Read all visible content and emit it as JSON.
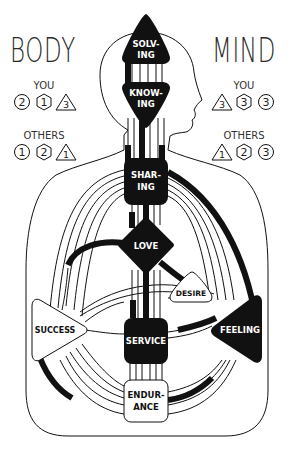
{
  "diagram": {
    "left_panel": {
      "title": "BODY",
      "you_label": "YOU",
      "you_icons": [
        {
          "shape": "circle",
          "value": "2"
        },
        {
          "shape": "hexagon",
          "value": "1"
        },
        {
          "shape": "triangle",
          "value": "3"
        }
      ],
      "others_label": "OTHERS",
      "others_icons": [
        {
          "shape": "circle",
          "value": "1"
        },
        {
          "shape": "hexagon",
          "value": "2"
        },
        {
          "shape": "triangle",
          "value": "1"
        }
      ]
    },
    "right_panel": {
      "title": "MIND",
      "you_label": "YOU",
      "you_icons": [
        {
          "shape": "triangle",
          "value": "3"
        },
        {
          "shape": "hexagon",
          "value": "3"
        },
        {
          "shape": "circle",
          "value": "3"
        }
      ],
      "others_label": "OTHERS",
      "others_icons": [
        {
          "shape": "triangle",
          "value": "1"
        },
        {
          "shape": "hexagon",
          "value": "2"
        },
        {
          "shape": "circle",
          "value": "3"
        }
      ]
    },
    "centers": {
      "solving": {
        "line1": "SOLV-",
        "line2": "ING",
        "defined": true,
        "shape": "triangle-up"
      },
      "knowing": {
        "line1": "KNOW-",
        "line2": "ING",
        "defined": true,
        "shape": "triangle-down"
      },
      "sharing": {
        "line1": "SHAR-",
        "line2": "ING",
        "defined": true,
        "shape": "square"
      },
      "love": {
        "label": "LOVE",
        "defined": true,
        "shape": "diamond"
      },
      "desire": {
        "label": "DESIRE",
        "defined": false,
        "shape": "triangle"
      },
      "success": {
        "label": "SUCCESS",
        "defined": false,
        "shape": "triangle-right"
      },
      "service": {
        "label": "SERVICE",
        "defined": true,
        "shape": "square"
      },
      "feeling": {
        "label": "FEELING",
        "defined": true,
        "shape": "triangle-left"
      },
      "endurance": {
        "line1": "ENDUR-",
        "line2": "ANCE",
        "defined": false,
        "shape": "square"
      }
    },
    "colors": {
      "defined": "#111111",
      "undefined": "#ffffff",
      "outline": "#111111"
    }
  }
}
